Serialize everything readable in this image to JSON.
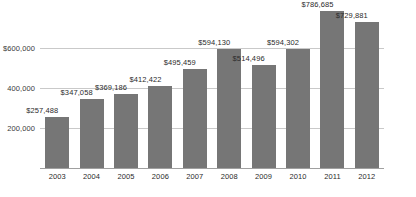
{
  "chart_data": {
    "type": "bar",
    "title": "",
    "subtitle": "",
    "xlabel": "",
    "ylabel": "",
    "categories": [
      "2003",
      "2004",
      "2005",
      "2006",
      "2007",
      "2008",
      "2009",
      "2010",
      "2011",
      "2012"
    ],
    "values": [
      257488,
      347058,
      369186,
      412422,
      495459,
      594130,
      514496,
      594302,
      786685,
      729881
    ],
    "data_labels": [
      "$257,488",
      "$347,058",
      "$369,186",
      "$412,422",
      "$495,459",
      "$594,130",
      "$514,496",
      "$594,302",
      "$786,685",
      "$729,881"
    ],
    "ylim": [
      0,
      800000
    ],
    "yticks": [
      200000,
      400000,
      600000
    ],
    "ytick_labels": [
      "200,000",
      "400,000",
      "$600,000"
    ],
    "grid": true,
    "legend": "none",
    "series": [
      {
        "name": "",
        "color": "#767676",
        "values": [
          257488,
          347058,
          369186,
          412422,
          495459,
          594130,
          514496,
          594302,
          786685,
          729881
        ]
      }
    ]
  },
  "style": {
    "bar_color": "#767676",
    "grid_color": "#c9c9c9",
    "axis_color": "#a0a0a0",
    "text_color": "#2b2b2b",
    "background": "#ffffff"
  }
}
